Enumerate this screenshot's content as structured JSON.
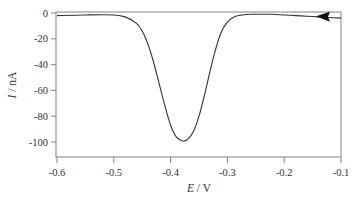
{
  "chart_data": {
    "type": "line",
    "title": "",
    "xlabel_var": "E",
    "xlabel_unit": " / V",
    "ylabel_var": "I",
    "ylabel_unit": " / nA",
    "xlim": [
      -0.6,
      -0.1
    ],
    "ylim": [
      -110,
      5
    ],
    "grid": false,
    "legend": null,
    "x_ticks": [
      -0.6,
      -0.5,
      -0.4,
      -0.3,
      -0.2,
      -0.1
    ],
    "x_tick_labels": [
      "-0.6",
      "-0.5",
      "-0.4",
      "-0.3",
      "-0.2",
      "-0.1"
    ],
    "y_ticks": [
      0,
      -20,
      -40,
      -60,
      -80,
      -100
    ],
    "y_tick_labels": [
      "0",
      "-20",
      "-40",
      "-60",
      "-80",
      "-100"
    ],
    "annotations": [
      {
        "type": "arrow",
        "description": "scan direction arrow pointing left",
        "x": -0.13,
        "y": -3
      }
    ],
    "series": [
      {
        "name": "voltammogram",
        "color": "#333333",
        "x": [
          -0.6,
          -0.55,
          -0.5,
          -0.48,
          -0.46,
          -0.45,
          -0.44,
          -0.43,
          -0.42,
          -0.41,
          -0.4,
          -0.39,
          -0.38,
          -0.375,
          -0.37,
          -0.36,
          -0.35,
          -0.34,
          -0.33,
          -0.32,
          -0.31,
          -0.3,
          -0.29,
          -0.28,
          -0.26,
          -0.24,
          -0.22,
          -0.2,
          -0.18,
          -0.16,
          -0.14,
          -0.12,
          -0.1
        ],
        "y": [
          -2,
          -1.5,
          -1.5,
          -3,
          -8,
          -14,
          -24,
          -38,
          -55,
          -72,
          -87,
          -96,
          -99,
          -99,
          -98,
          -92,
          -80,
          -63,
          -44,
          -27,
          -14,
          -7,
          -3.5,
          -2,
          -1,
          -1,
          -1,
          -1.5,
          -2,
          -2.5,
          -3,
          -3.5,
          -4
        ]
      }
    ]
  }
}
